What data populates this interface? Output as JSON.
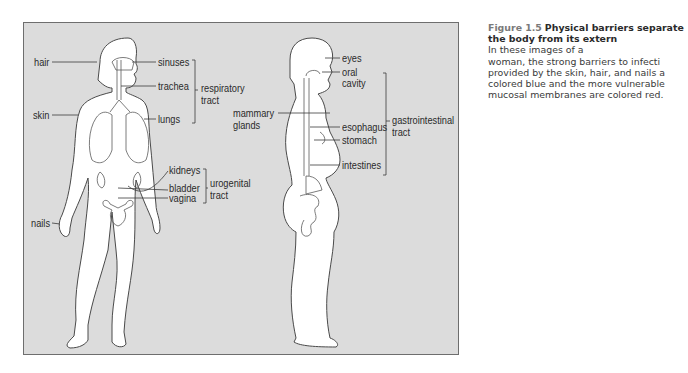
{
  "figure": {
    "number": "Figure 1.5",
    "title_visible": "Physical barriers separate the body from its extern",
    "body_lines": [
      "In these images of a",
      "woman, the strong barriers to infecti",
      "provided by the skin, hair, and nails a",
      "colored blue and the more vulnerable",
      "mucosal membranes are colored red."
    ]
  },
  "front_view": {
    "left_labels": [
      "hair",
      "skin",
      "nails"
    ],
    "right_labels": [
      "sinuses",
      "trachea",
      "lungs",
      "kidneys",
      "bladder",
      "vagina"
    ],
    "groups": [
      {
        "name_line1": "respiratory",
        "name_line2": "tract",
        "members": [
          "sinuses",
          "trachea",
          "lungs"
        ]
      },
      {
        "name_line1": "urogenital",
        "name_line2": "tract",
        "members": [
          "kidneys",
          "bladder",
          "vagina"
        ]
      }
    ]
  },
  "side_view": {
    "left_labels": [
      {
        "line1": "mammary",
        "line2": "glands"
      }
    ],
    "right_labels": [
      "eyes",
      "oral",
      "cavity",
      "esophagus",
      "stomach",
      "intestines"
    ],
    "groups": [
      {
        "name_line1": "gastrointestinal",
        "name_line2": "tract",
        "members": [
          "oral cavity",
          "esophagus",
          "stomach",
          "intestines"
        ]
      }
    ]
  },
  "colors": {
    "panel_bg": "#dcdcdc",
    "panel_border": "#6e6e6e",
    "figure_fill": "#ffffff",
    "outline": "#4a4a4a",
    "label_text": "#2a2a2a"
  }
}
